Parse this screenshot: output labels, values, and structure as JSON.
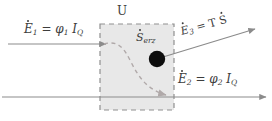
{
  "diagram": {
    "title_label": "U",
    "background_color": "#ffffff",
    "box_fill_color": "#e8e8e8",
    "box_border_color": "#8f8f8f",
    "arrow_color": "#8b8b8b",
    "entropy_source_color": "#0d0d0d",
    "curve_color": "#b0a9a9",
    "box": {
      "x": 100,
      "y": 24,
      "width": 74,
      "height": 86
    },
    "entropy_source": {
      "cx": 157,
      "cy": 59,
      "r": 8,
      "name": "entropy-generation-node"
    },
    "labels": {
      "u": "U",
      "e1": {
        "symbol": "E",
        "sub": "1",
        "equals": "=",
        "phi": "φ",
        "phi_sub": "1",
        "current": "I",
        "current_sub": "Q"
      },
      "e2": {
        "symbol": "E",
        "sub": "2",
        "equals": "=",
        "phi": "φ",
        "phi_sub": "2",
        "current": "I",
        "current_sub": "Q"
      },
      "e3": {
        "symbol": "E",
        "sub": "3",
        "equals": "=",
        "temp": "T",
        "entropy": "S"
      },
      "serz": {
        "symbol": "S",
        "sub": "erz"
      }
    },
    "flows": [
      {
        "name": "energy-inflow-1",
        "label": "Ė₁ = φ₁ I_Q",
        "direction": "in-left"
      },
      {
        "name": "energy-outflow-2",
        "label": "Ė₂ = φ₂ I_Q",
        "direction": "out-right-bottom"
      },
      {
        "name": "energy-outflow-3",
        "label": "Ė₃ = T Ṡ",
        "direction": "out-upper-right"
      }
    ]
  }
}
